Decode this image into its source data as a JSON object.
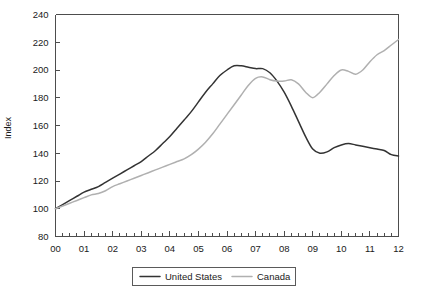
{
  "chart_data": {
    "type": "line",
    "title": "",
    "xlabel": "",
    "ylabel": "Index",
    "ylim": [
      80,
      240
    ],
    "xlim": [
      2000,
      2012
    ],
    "yticks": [
      80,
      100,
      120,
      140,
      160,
      180,
      200,
      220,
      240
    ],
    "xticks": [
      2000,
      2001,
      2002,
      2003,
      2004,
      2005,
      2006,
      2007,
      2008,
      2009,
      2010,
      2011,
      2012
    ],
    "xtick_labels": [
      "00",
      "01",
      "02",
      "03",
      "04",
      "05",
      "06",
      "07",
      "08",
      "09",
      "10",
      "11",
      "12"
    ],
    "grid": false,
    "legend_position": "bottom-center",
    "minor_ticks_per_year": 4,
    "series": [
      {
        "name": "United States",
        "color": "#333333",
        "width": 1.5,
        "x": [
          2000.0,
          2000.25,
          2000.5,
          2000.75,
          2001.0,
          2001.25,
          2001.5,
          2001.75,
          2002.0,
          2002.25,
          2002.5,
          2002.75,
          2003.0,
          2003.25,
          2003.5,
          2003.75,
          2004.0,
          2004.25,
          2004.5,
          2004.75,
          2005.0,
          2005.25,
          2005.5,
          2005.75,
          2006.0,
          2006.25,
          2006.5,
          2006.75,
          2007.0,
          2007.25,
          2007.5,
          2007.75,
          2008.0,
          2008.25,
          2008.5,
          2008.75,
          2009.0,
          2009.25,
          2009.5,
          2009.75,
          2010.0,
          2010.25,
          2010.5,
          2010.75,
          2011.0,
          2011.25,
          2011.5,
          2011.75,
          2012.0
        ],
        "y": [
          100,
          103,
          106,
          109,
          112,
          114,
          116,
          119,
          122,
          125,
          128,
          131,
          134,
          138,
          142,
          147,
          152,
          158,
          164,
          170,
          177,
          184,
          190,
          196,
          200,
          203,
          203,
          202,
          201,
          201,
          198,
          192,
          184,
          174,
          163,
          152,
          143,
          140,
          141,
          144,
          146,
          147,
          146,
          145,
          144,
          143,
          142,
          139,
          138
        ]
      },
      {
        "name": "Canada",
        "color": "#b0b0b0",
        "width": 1.5,
        "x": [
          2000.0,
          2000.25,
          2000.5,
          2000.75,
          2001.0,
          2001.25,
          2001.5,
          2001.75,
          2002.0,
          2002.25,
          2002.5,
          2002.75,
          2003.0,
          2003.25,
          2003.5,
          2003.75,
          2004.0,
          2004.25,
          2004.5,
          2004.75,
          2005.0,
          2005.25,
          2005.5,
          2005.75,
          2006.0,
          2006.25,
          2006.5,
          2006.75,
          2007.0,
          2007.25,
          2007.5,
          2007.75,
          2008.0,
          2008.25,
          2008.5,
          2008.75,
          2009.0,
          2009.25,
          2009.5,
          2009.75,
          2010.0,
          2010.25,
          2010.5,
          2010.75,
          2011.0,
          2011.25,
          2011.5,
          2011.75,
          2012.0
        ],
        "y": [
          100,
          102,
          104,
          106,
          108,
          110,
          111,
          113,
          116,
          118,
          120,
          122,
          124,
          126,
          128,
          130,
          132,
          134,
          136,
          139,
          143,
          148,
          154,
          161,
          168,
          175,
          182,
          189,
          194,
          195,
          193,
          192,
          192,
          193,
          190,
          184,
          180,
          184,
          190,
          196,
          200,
          199,
          197,
          200,
          206,
          211,
          214,
          218,
          222
        ]
      }
    ]
  },
  "legend": {
    "entries": [
      {
        "label": "United States",
        "color": "#333333"
      },
      {
        "label": "Canada",
        "color": "#b0b0b0"
      }
    ]
  },
  "axis": {
    "y_title": "Index",
    "y_labels": [
      "240",
      "220",
      "200",
      "180",
      "160",
      "140",
      "120",
      "100",
      "80"
    ],
    "x_labels": [
      "00",
      "01",
      "02",
      "03",
      "04",
      "05",
      "06",
      "07",
      "08",
      "09",
      "10",
      "11",
      "12"
    ]
  }
}
